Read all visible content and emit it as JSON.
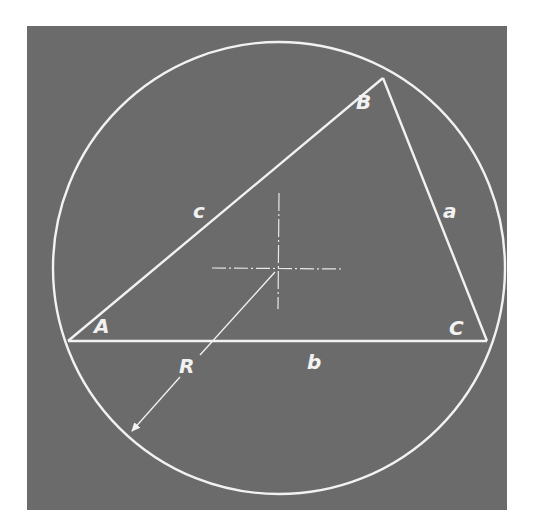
{
  "figure": {
    "colors": {
      "background": "#ffffff",
      "panel": "#6b6b6b",
      "lines": "#f2f2f2"
    },
    "circle": {
      "center": [
        279,
        268
      ],
      "radius": 226
    },
    "vertices": {
      "A": {
        "label": "A",
        "point": [
          68,
          341
        ]
      },
      "B": {
        "label": "B",
        "point": [
          383,
          78
        ]
      },
      "C": {
        "label": "C",
        "point": [
          487,
          341
        ]
      }
    },
    "sides": {
      "a": {
        "label": "a",
        "from": "B",
        "to": "C"
      },
      "b": {
        "label": "b",
        "from": "A",
        "to": "C"
      },
      "c": {
        "label": "c",
        "from": "A",
        "to": "B"
      }
    },
    "radius_label": "R",
    "center_mark": "crosshair-centerline"
  }
}
